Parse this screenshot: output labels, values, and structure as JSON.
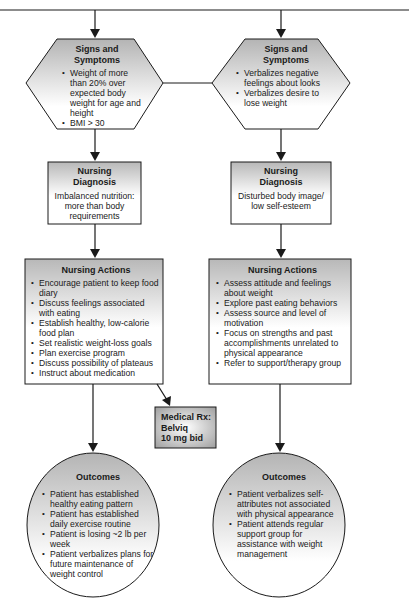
{
  "diagram": {
    "colors": {
      "stroke": "#1a1a1a",
      "fill_top": "#b9b9b9",
      "fill_bottom": "#ffffff",
      "rx_fill_center": "#ffffff",
      "rx_fill_edge": "#a8a8a8"
    },
    "left": {
      "signs": {
        "title": "Signs and Symptoms",
        "items": [
          "Weight of more than 20% over expected body weight for age and height",
          "BMI > 30"
        ]
      },
      "diagnosis": {
        "title": "Nursing Diagnosis",
        "text": "Imbalanced nutrition: more than body requirements"
      },
      "actions": {
        "title": "Nursing Actions",
        "items": [
          "Encourage patient to keep food diary",
          "Discuss feelings associated with eating",
          "Establish healthy, low-calorie food plan",
          "Set realistic weight-loss goals",
          "Plan exercise program",
          "Discuss possibility of plateaus",
          "Instruct about medication"
        ]
      },
      "medical_rx": {
        "line1": "Medical Rx:",
        "line2": "Belviq",
        "line3": "10 mg bid"
      },
      "outcomes": {
        "title": "Outcomes",
        "items": [
          "Patient has established healthy eating pattern",
          "Patient has established daily exercise routine",
          "Patient is losing ~2 lb per week",
          "Patient verbalizes plans for future maintenance of weight control"
        ]
      }
    },
    "right": {
      "signs": {
        "title": "Signs and Symptoms",
        "items": [
          "Verbalizes negative feelings about looks",
          "Verbalizes desire to lose weight"
        ]
      },
      "diagnosis": {
        "title": "Nursing Diagnosis",
        "text": "Disturbed body image/ low self-esteem"
      },
      "actions": {
        "title": "Nursing Actions",
        "items": [
          "Assess attitude and feelings about weight",
          "Explore past eating behaviors",
          "Assess source and level of motivation",
          "Focus on strengths and past accomplishments unrelated to physical appearance",
          "Refer to support/therapy group"
        ]
      },
      "outcomes": {
        "title": "Outcomes",
        "items": [
          "Patient verbalizes self-attributes not associated with physical appearance",
          "Patient attends regular support group for assistance with weight management"
        ]
      }
    }
  }
}
